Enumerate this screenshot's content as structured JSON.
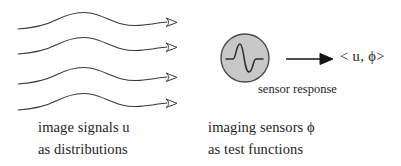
{
  "figure": {
    "background_color": "#ffffff",
    "stroke_color": "#3a3a3a",
    "ink_color": "#1a1a1a",
    "sensor_fill_color": "#c8c8c8",
    "sensor_stroke_color": "#4a4a4a",
    "arrowhead_fill_color": "#ffffff"
  },
  "signals": {
    "caption_line1": "image signals u",
    "caption_line2": "as distributions",
    "wave_count": 4,
    "arrowhead_style": "hollow"
  },
  "sensors": {
    "caption_line1": "imaging sensors ϕ",
    "caption_line2": "as test functions",
    "icon_name": "wavelet-in-circle",
    "wavelet_shape": "derivative-of-gaussian"
  },
  "response": {
    "label": "sensor response",
    "arrow_direction": "right",
    "formula": "< u,  ϕ>"
  }
}
